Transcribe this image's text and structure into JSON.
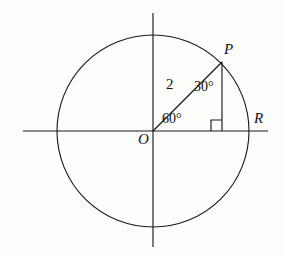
{
  "figure": {
    "type": "geometry-diagram",
    "background_color": "#fdfdfc",
    "stroke_color": "#1a1a1a"
  },
  "labels": {
    "point_p": "P",
    "point_r": "R",
    "origin_o": "O",
    "angle_at_p": "30°",
    "angle_at_origin": "60°",
    "radius_length": "2"
  },
  "geometry": {
    "circle": {
      "cx": 153,
      "cy": 131,
      "r": 96
    },
    "x_axis": {
      "x1": 23,
      "y1": 131,
      "x2": 268,
      "y2": 131
    },
    "y_axis": {
      "x1": 153,
      "y1": 13,
      "x2": 153,
      "y2": 247
    },
    "radius_segment": {
      "x1": 153,
      "y1": 131,
      "x2": 222,
      "y2": 62
    },
    "drop_segment": {
      "x1": 222,
      "y1": 62,
      "x2": 222,
      "y2": 131
    },
    "right_angle_marker": {
      "x": 211,
      "y": 120,
      "size": 11
    },
    "point_p_coords": {
      "x": 222,
      "y": 62
    },
    "point_r_coords": {
      "x": 249,
      "y": 131
    },
    "origin_coords": {
      "x": 153,
      "y": 131
    }
  }
}
